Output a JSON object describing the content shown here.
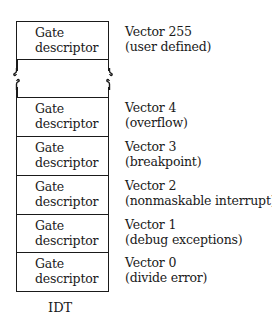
{
  "diagram": {
    "title": "IDT",
    "entries": [
      {
        "cell": "Gate\ndescriptor",
        "cell_line1": "Gate",
        "cell_line2": "descriptor",
        "vector": "Vector 255",
        "description": "(user defined)"
      },
      {
        "cell_line1": "Gate",
        "cell_line2": "descriptor",
        "vector": "Vector 4",
        "description": "(overflow)"
      },
      {
        "cell_line1": "Gate",
        "cell_line2": "descriptor",
        "vector": "Vector 3",
        "description": "(breakpoint)"
      },
      {
        "cell_line1": "Gate",
        "cell_line2": "descriptor",
        "vector": "Vector 2",
        "description": "(nonmaskable interrupt)"
      },
      {
        "cell_line1": "Gate",
        "cell_line2": "descriptor",
        "vector": "Vector 1",
        "description": "(debug exceptions)"
      },
      {
        "cell_line1": "Gate",
        "cell_line2": "descriptor",
        "vector": "Vector 0",
        "description": "(divide error)"
      }
    ],
    "break_marker": "omitted-entries"
  }
}
